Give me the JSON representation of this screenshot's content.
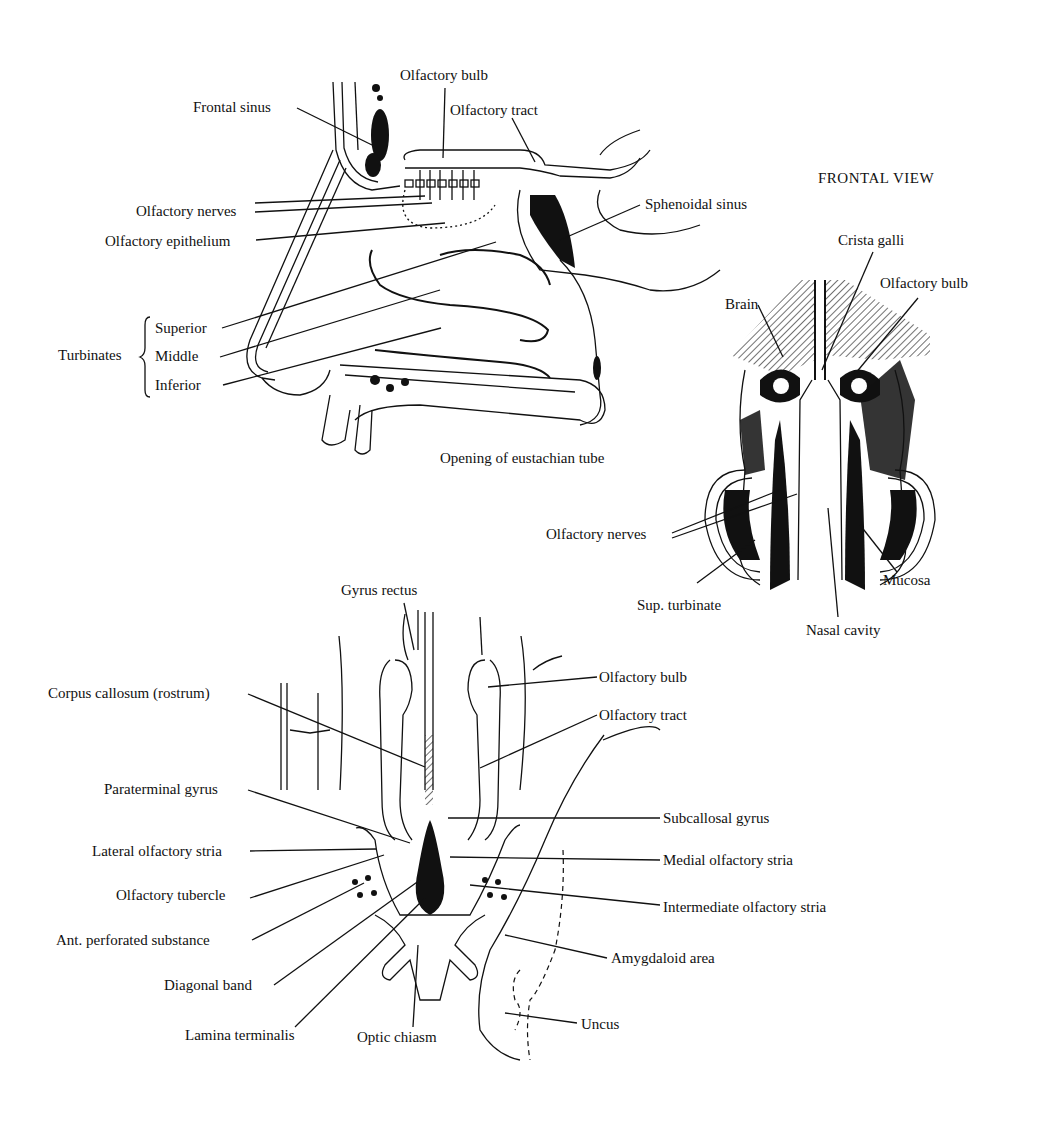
{
  "sagittal_view": {
    "labels": {
      "olfactory_bulb": "Olfactory bulb",
      "frontal_sinus": "Frontal sinus",
      "olfactory_tract": "Olfactory tract",
      "olfactory_nerves": "Olfactory nerves",
      "olfactory_epithelium": "Olfactory epithelium",
      "sphenoidal_sinus": "Sphenoidal sinus",
      "turbinates": "Turbinates",
      "superior": "Superior",
      "middle": "Middle",
      "inferior": "Inferior",
      "eustachian_tube": "Opening of eustachian tube"
    }
  },
  "frontal_view": {
    "title": "FRONTAL VIEW",
    "labels": {
      "crista_galli": "Crista galli",
      "brain": "Brain",
      "olfactory_bulb": "Olfactory bulb",
      "olfactory_nerves": "Olfactory nerves",
      "mucosa": "Mucosa",
      "sup_turbinate": "Sup. turbinate",
      "nasal_cavity": "Nasal cavity"
    }
  },
  "basal_view": {
    "labels": {
      "gyrus_rectus": "Gyrus rectus",
      "corpus_callosum": "Corpus callosum (rostrum)",
      "olfactory_bulb": "Olfactory bulb",
      "olfactory_tract": "Olfactory tract",
      "paraterminal_gyrus": "Paraterminal gyrus",
      "subcallosal_gyrus": "Subcallosal gyrus",
      "lateral_olfactory_stria": "Lateral olfactory stria",
      "medial_olfactory_stria": "Medial olfactory stria",
      "olfactory_tubercle": "Olfactory tubercle",
      "intermediate_olfactory_stria": "Intermediate olfactory stria",
      "ant_perforated_substance": "Ant. perforated substance",
      "amygdaloid_area": "Amygdaloid area",
      "diagonal_band": "Diagonal band",
      "lamina_terminalis": "Lamina terminalis",
      "optic_chiasm": "Optic chiasm",
      "uncus": "Uncus"
    }
  }
}
